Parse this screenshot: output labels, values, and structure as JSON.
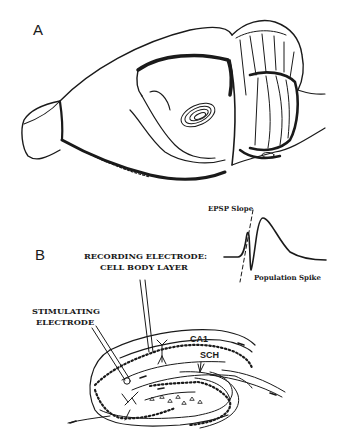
{
  "figure": {
    "panel_a": {
      "label": "A",
      "subject": "rat-brain-lateral-view"
    },
    "panel_b": {
      "label": "B",
      "subject": "hippocampal-slice-diagram",
      "recording_electrode_line1": "RECORDING ELECTRODE:",
      "recording_electrode_line2": "CELL BODY LAYER",
      "stimulating_electrode_line1": "STIMULATING",
      "stimulating_electrode_line2": "ELECTRODE",
      "region_ca1": "CA1",
      "region_sch": "SCH",
      "trace": {
        "epsp_label": "EPSP Slope",
        "spike_label": "Population Spike"
      }
    }
  },
  "colors": {
    "ink": "#1a1a1a",
    "background": "#ffffff"
  }
}
